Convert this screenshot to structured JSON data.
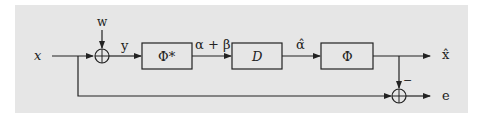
{
  "diagram": {
    "type": "block-diagram",
    "background_color": "#e6e6e6",
    "line_color": "#222222",
    "inputs": {
      "x": "x",
      "w": "w"
    },
    "signals": {
      "y": "y",
      "alpha_plus_beta": "α + β",
      "alpha_hat": "α̂",
      "x_hat": "x̂",
      "e": "e"
    },
    "blocks": [
      {
        "id": "phi_star",
        "label": "Φ*"
      },
      {
        "id": "D",
        "label": "D"
      },
      {
        "id": "phi",
        "label": "Φ"
      }
    ],
    "summing_junctions": [
      {
        "id": "sum1",
        "inputs": [
          "x",
          "w"
        ],
        "output": "y"
      },
      {
        "id": "sum2",
        "inputs": [
          "x",
          "x̂"
        ],
        "sign_label": "−",
        "output": "e"
      }
    ]
  }
}
